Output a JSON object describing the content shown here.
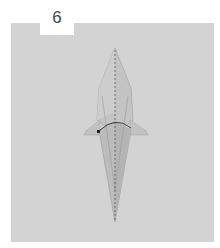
{
  "step": {
    "number": "6"
  },
  "figure": {
    "colors": {
      "background": "#ffffff",
      "panel": "#d3d3d3",
      "paper_light": "#c9c9c9",
      "paper_mid": "#bdbdbd",
      "paper_dark": "#a9a9a9",
      "fold_line": "#555555",
      "arrow": "#333333"
    }
  }
}
